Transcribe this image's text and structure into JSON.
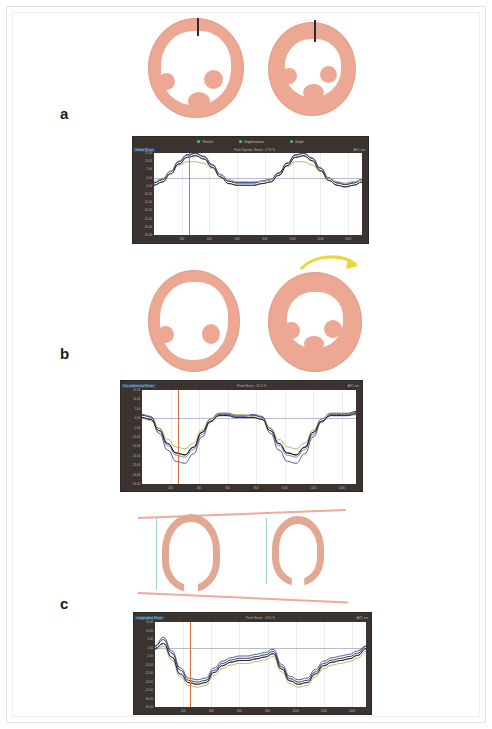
{
  "figure": {
    "type": "multi-panel-cardiac-strain-figure",
    "panel_count": 3,
    "background_color": "#ffffff",
    "tissue_color": "#eda893",
    "chart_frame_color": "#3a332f"
  },
  "panels": [
    {
      "id": "a",
      "label": "a",
      "view": "short-axis",
      "description": "Short-axis myocardial cross-sections, basal level, paired end-diastole and end-systole",
      "images": [
        {
          "name": "short-axis-diastole",
          "marker": "septal-reference-line"
        },
        {
          "name": "short-axis-systole",
          "marker": "septal-reference-line"
        }
      ],
      "annotation": "",
      "chart": {
        "name": "longitudinal-strain-chart",
        "legend": [
          {
            "label": "Results",
            "color": "#5fbf5f"
          },
          {
            "label": "Segmentation",
            "color": "#5fbf5f"
          },
          {
            "label": "Graph",
            "color": "#5fbf5f"
          }
        ],
        "title_left": "Global Strain",
        "title_mid": "Peak Systolic Strain: -17.8 %",
        "title_right": "AVC  ms",
        "y_ticks": [
          "15.00",
          "10.00",
          "5.00",
          "0.00",
          "-5.00",
          "-10.00",
          "-15.00",
          "-20.00",
          "-25.00",
          "-30.00",
          "-35.00"
        ],
        "x_ticks": [
          "200",
          "400",
          "600",
          "800",
          "1000",
          "1200",
          "1400"
        ]
      }
    },
    {
      "id": "b",
      "label": "b",
      "view": "short-axis-rotation",
      "description": "Short-axis cross-sections demonstrating rotational twist, yellow curved arrow marks direction of rotation",
      "images": [
        {
          "name": "short-axis-basal",
          "marker": "none"
        },
        {
          "name": "short-axis-apical-rotated",
          "marker": "rotation-arrow"
        }
      ],
      "arrow": {
        "name": "rotation-arrow",
        "color": "#e8d93a",
        "direction": "clockwise"
      },
      "annotation": "",
      "chart": {
        "name": "rotation-strain-chart",
        "legend": [],
        "title_left": "Circumferential Strain",
        "title_mid": "Peak Strain: -21.4 %",
        "title_right": "AVC  ms",
        "y_ticks": [
          "15.00",
          "10.00",
          "5.00",
          "0.00",
          "-5.00",
          "-10.00",
          "-15.00",
          "-20.00",
          "-25.00",
          "-30.00",
          "-35.00"
        ],
        "x_ticks": [
          "200",
          "400",
          "600",
          "800",
          "1000",
          "1200",
          "1400"
        ]
      }
    },
    {
      "id": "c",
      "label": "c",
      "view": "long-axis",
      "description": "Long-axis four-chamber views with pink base-to-apex reference lines showing longitudinal shortening",
      "images": [
        {
          "name": "long-axis-diastole",
          "marker": "reference-lines"
        },
        {
          "name": "long-axis-systole",
          "marker": "reference-lines"
        }
      ],
      "annotation": "",
      "chart": {
        "name": "longitudinal-shortening-chart",
        "legend": [],
        "title_left": "Longitudinal Strain",
        "title_mid": "Peak Strain: -19.6 %",
        "title_right": "AVC  ms",
        "y_ticks": [
          "15.00",
          "10.00",
          "5.00",
          "0.00",
          "-5.00",
          "-10.00",
          "-15.00",
          "-20.00",
          "-25.00",
          "-30.00",
          "-35.00"
        ],
        "x_ticks": [
          "200",
          "400",
          "600",
          "800",
          "1000",
          "1200",
          "1400"
        ]
      }
    }
  ],
  "chart_data": [
    {
      "type": "line",
      "panel": "a",
      "title": "Global Strain",
      "xlabel": "Time (ms)",
      "ylabel": "Strain (%)",
      "ylim": [
        -35,
        15
      ],
      "xlim": [
        0,
        1500
      ],
      "grid": true,
      "legend_position": "top",
      "baseline_y": 0,
      "cursor_x": 250,
      "x": [
        0,
        60,
        120,
        180,
        240,
        300,
        360,
        420,
        480,
        540,
        600,
        660,
        720,
        780,
        840,
        900,
        960,
        1020,
        1080,
        1140,
        1200,
        1260,
        1320,
        1380,
        1440,
        1500
      ],
      "series": [
        {
          "name": "segment-navy",
          "color": "#1c2340",
          "values": [
            -4,
            -2,
            3,
            9,
            13,
            14,
            12,
            7,
            1,
            -3,
            -4,
            -4,
            -4,
            -3,
            -2,
            2,
            8,
            13,
            14,
            11,
            5,
            -1,
            -4,
            -5,
            -4,
            -2
          ]
        },
        {
          "name": "segment-gray",
          "color": "#7b7f8c",
          "values": [
            -5,
            -3,
            2,
            8,
            12,
            13,
            11,
            6,
            0,
            -4,
            -5,
            -5,
            -5,
            -4,
            -3,
            1,
            7,
            12,
            13,
            10,
            4,
            -2,
            -5,
            -6,
            -5,
            -3
          ]
        },
        {
          "name": "segment-blue",
          "color": "#3a4d8f",
          "values": [
            -3,
            -1,
            4,
            10,
            14,
            15,
            13,
            8,
            2,
            -2,
            -3,
            -3,
            -3,
            -2,
            -1,
            3,
            9,
            14,
            15,
            12,
            6,
            0,
            -3,
            -4,
            -3,
            -1
          ]
        },
        {
          "name": "segment-olive",
          "color": "#b5ab5a",
          "values": [
            -2,
            0,
            4,
            8,
            10,
            10,
            9,
            6,
            2,
            -1,
            -2,
            -2,
            -2,
            -2,
            -1,
            2,
            7,
            10,
            10,
            8,
            4,
            0,
            -2,
            -3,
            -2,
            -1
          ]
        },
        {
          "name": "segment-black",
          "color": "#101018",
          "values": [
            -4,
            -2,
            3,
            9,
            13,
            14,
            12,
            7,
            1,
            -3,
            -4,
            -4,
            -4,
            -3,
            -2,
            2,
            8,
            13,
            14,
            11,
            5,
            -1,
            -4,
            -5,
            -4,
            -2
          ]
        }
      ]
    },
    {
      "type": "line",
      "panel": "b",
      "title": "Circumferential Strain",
      "xlabel": "Time (ms)",
      "ylabel": "Strain (%)",
      "ylim": [
        -35,
        15
      ],
      "xlim": [
        0,
        1500
      ],
      "grid": true,
      "legend_position": "none",
      "baseline_y": 0,
      "cursor_x": 250,
      "x": [
        0,
        60,
        120,
        180,
        240,
        300,
        360,
        420,
        480,
        540,
        600,
        660,
        720,
        780,
        840,
        900,
        960,
        1020,
        1080,
        1140,
        1200,
        1260,
        1320,
        1380,
        1440,
        1500
      ],
      "series": [
        {
          "name": "segment-navy",
          "color": "#1c2340",
          "values": [
            1,
            0,
            -6,
            -14,
            -19,
            -20,
            -16,
            -8,
            -1,
            2,
            2,
            1,
            1,
            1,
            0,
            -6,
            -14,
            -19,
            -20,
            -16,
            -8,
            -1,
            2,
            2,
            2,
            3
          ]
        },
        {
          "name": "segment-gray",
          "color": "#7b7f8c",
          "values": [
            0,
            -1,
            -7,
            -15,
            -20,
            -21,
            -17,
            -9,
            -2,
            1,
            1,
            0,
            0,
            0,
            -1,
            -7,
            -15,
            -20,
            -21,
            -17,
            -9,
            -2,
            1,
            1,
            1,
            2
          ]
        },
        {
          "name": "segment-blue",
          "color": "#3a4d8f",
          "values": [
            2,
            1,
            -8,
            -17,
            -23,
            -24,
            -19,
            -10,
            -2,
            2,
            2,
            1,
            1,
            2,
            1,
            -8,
            -17,
            -23,
            -24,
            -19,
            -10,
            -2,
            2,
            2,
            2,
            3
          ]
        },
        {
          "name": "segment-olive",
          "color": "#b5ab5a",
          "values": [
            0,
            -1,
            -5,
            -11,
            -15,
            -16,
            -13,
            -6,
            0,
            3,
            3,
            2,
            2,
            1,
            0,
            -5,
            -11,
            -15,
            -16,
            -13,
            -6,
            0,
            3,
            3,
            2,
            2
          ]
        },
        {
          "name": "segment-black",
          "color": "#101018",
          "values": [
            1,
            0,
            -6,
            -13,
            -18,
            -19,
            -15,
            -7,
            -1,
            2,
            2,
            1,
            1,
            1,
            0,
            -6,
            -13,
            -18,
            -19,
            -15,
            -7,
            -1,
            2,
            2,
            2,
            3
          ]
        }
      ]
    },
    {
      "type": "line",
      "panel": "c",
      "title": "Longitudinal Strain",
      "xlabel": "Time (ms)",
      "ylabel": "Strain (%)",
      "ylim": [
        -35,
        15
      ],
      "xlim": [
        0,
        1500
      ],
      "grid": true,
      "legend_position": "none",
      "baseline_y": 0,
      "cursor_x": 250,
      "x": [
        0,
        60,
        120,
        180,
        240,
        300,
        360,
        420,
        480,
        540,
        600,
        660,
        720,
        780,
        840,
        900,
        960,
        1020,
        1080,
        1140,
        1200,
        1260,
        1320,
        1380,
        1440,
        1500
      ],
      "series": [
        {
          "name": "segment-navy",
          "color": "#1c2340",
          "values": [
            0,
            4,
            -4,
            -14,
            -20,
            -21,
            -20,
            -14,
            -10,
            -8,
            -7,
            -7,
            -6,
            -5,
            -3,
            -12,
            -19,
            -21,
            -20,
            -15,
            -10,
            -8,
            -7,
            -6,
            -4,
            0
          ]
        },
        {
          "name": "segment-gray",
          "color": "#7b7f8c",
          "values": [
            -1,
            2,
            -6,
            -16,
            -21,
            -22,
            -21,
            -15,
            -11,
            -9,
            -8,
            -8,
            -7,
            -6,
            -4,
            -13,
            -20,
            -22,
            -21,
            -16,
            -11,
            -9,
            -8,
            -7,
            -5,
            -1
          ]
        },
        {
          "name": "segment-blue",
          "color": "#3a4d8f",
          "values": [
            1,
            6,
            -2,
            -12,
            -18,
            -19,
            -18,
            -12,
            -8,
            -6,
            -5,
            -5,
            -4,
            -3,
            -1,
            -10,
            -17,
            -19,
            -18,
            -13,
            -8,
            -6,
            -5,
            -4,
            -2,
            1
          ]
        },
        {
          "name": "segment-olive",
          "color": "#b5ab5a",
          "values": [
            -1,
            1,
            -7,
            -17,
            -22,
            -23,
            -22,
            -16,
            -12,
            -10,
            -9,
            -9,
            -8,
            -7,
            -5,
            -14,
            -21,
            -23,
            -22,
            -17,
            -12,
            -10,
            -9,
            -8,
            -6,
            -2
          ]
        },
        {
          "name": "segment-black",
          "color": "#101018",
          "values": [
            0,
            3,
            -5,
            -15,
            -20,
            -21,
            -20,
            -14,
            -10,
            -8,
            -7,
            -7,
            -6,
            -5,
            -3,
            -12,
            -19,
            -21,
            -20,
            -15,
            -10,
            -8,
            -7,
            -6,
            -4,
            0
          ]
        }
      ]
    }
  ]
}
